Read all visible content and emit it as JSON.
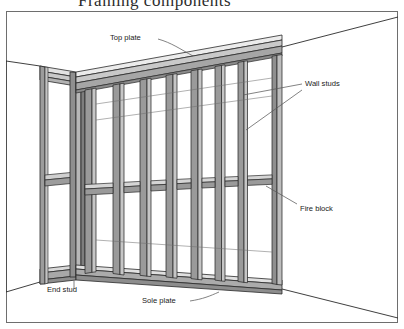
{
  "figure": {
    "title_cropped": "Framing components",
    "frame_border_color": "#6e6e6e",
    "background_color": "#ffffff",
    "line_color": "#2a2a2a",
    "leader_line_color": "#5a5a5a",
    "lumber_fill_front": "#9c9c9c",
    "lumber_fill_side": "#c9c9c9",
    "lumber_fill_top": "#e2e2e2",
    "lumber_fill_dark": "#7e7e7e",
    "label_color": "#1a1a1a"
  },
  "labels": {
    "top_plate": "Top plate",
    "wall_studs": "Wall studs",
    "fire_block": "Fire block",
    "end_stud": "End stud",
    "sole_plate": "Sole plate"
  },
  "label_positions": {
    "top_plate": {
      "x": 110,
      "y": 40
    },
    "wall_studs": {
      "x": 305,
      "y": 86
    },
    "fire_block": {
      "x": 300,
      "y": 211
    },
    "end_stud": {
      "x": 47,
      "y": 292
    },
    "sole_plate": {
      "x": 142,
      "y": 303
    }
  },
  "diagram_parts": [
    {
      "name": "top-plate",
      "description": "Double horizontal plate running along the top of the wall frame"
    },
    {
      "name": "wall-studs",
      "description": "Vertical members spaced evenly along the wall"
    },
    {
      "name": "fire-block",
      "description": "Short horizontal blocking pieces between studs at mid-height"
    },
    {
      "name": "end-stud",
      "description": "Corner stud where the two walls meet"
    },
    {
      "name": "sole-plate",
      "description": "Bottom horizontal plate resting on the floor"
    }
  ]
}
